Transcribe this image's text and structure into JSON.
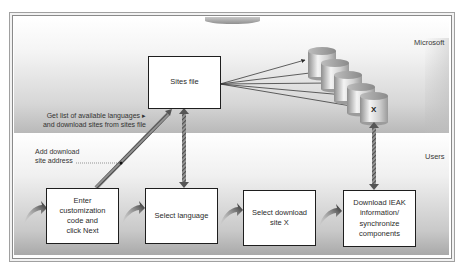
{
  "zones": {
    "top": {
      "label": "Microsoft"
    },
    "bottom": {
      "label": "Users"
    }
  },
  "sites_file": {
    "label": "Sites file"
  },
  "download_sites": {
    "count": 5,
    "selected_label": "X"
  },
  "annotations": {
    "get_list": {
      "line1": "Get list of available languages ▸",
      "line2": "and download sites from sites file"
    },
    "add_address": {
      "line1": "Add download",
      "line2": "site address"
    }
  },
  "steps": [
    {
      "lines": [
        "Enter",
        "customization",
        "code and",
        "click Next"
      ]
    },
    {
      "lines": [
        "Select language"
      ]
    },
    {
      "lines": [
        "Select download",
        "site X"
      ]
    },
    {
      "lines": [
        "Download IEAK",
        "information/",
        "synchronize",
        "components"
      ]
    }
  ],
  "colors": {
    "box_border": "#1e1e1e",
    "arrow_dark": "#2a2a2a",
    "hatched_arrow": "#6f6f6f"
  }
}
